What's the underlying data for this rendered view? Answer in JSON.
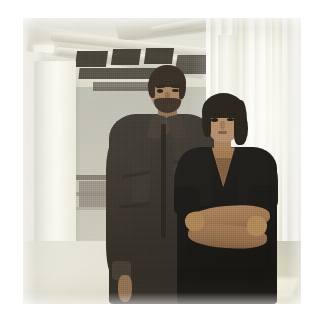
{
  "page": {
    "background_color": "#ffffff",
    "width": 319,
    "height": 321
  },
  "photo": {
    "alt": "Two people standing side by side in an open industrial loft office",
    "frame": {
      "x": 23,
      "y": 18,
      "width": 278,
      "height": 286
    },
    "caption": "",
    "palette": {
      "background_white": "#ffffff",
      "ceiling_light": "#efeee6",
      "ceiling_dark_ducts": "#272219",
      "wall_grey_green": "#c2c1b5",
      "window_bright": "#fbfaf4",
      "floor_warm": "#e9e5cd",
      "man_shirt_dark_brown": "#2d2822",
      "woman_top_black": "#0e0d0b",
      "skin_warm_brown": "#a67f5e",
      "hair_black": "#1d1711"
    },
    "scene": {
      "setting": "open-plan industrial loft interior",
      "lighting": "bright daylight from right-hand windows",
      "elements": [
        {
          "name": "ceiling-ducts",
          "description": "exposed diagonal ductwork and round pipes across the ceiling"
        },
        {
          "name": "ceiling-cavities",
          "description": "dark rectangular openings and HVAC boxes in the ceiling"
        },
        {
          "name": "ceiling-light",
          "description": "small bright fixture at upper left"
        },
        {
          "name": "left-column",
          "description": "white structural column or partition at the left"
        },
        {
          "name": "background-shelving",
          "description": "low shelving and equipment behind the left column"
        },
        {
          "name": "window-blinds",
          "description": "floor-to-ceiling vertical blinds along the right wall"
        },
        {
          "name": "sunlight-patches",
          "description": "angled pools of sunlight on the floor at lower right"
        }
      ],
      "subjects": [
        {
          "name": "man",
          "position": "left",
          "pose": "standing, facing camera",
          "hair": "short dark, receding",
          "facial_hair": "dark beard and moustache",
          "clothing": "dark charcoal-brown long-sleeve button shirt, sleeves rolled"
        },
        {
          "name": "woman",
          "position": "right",
          "pose": "standing, arms crossed",
          "hair": "dark, pulled back",
          "clothing": "black short-sleeve V-neck top"
        }
      ]
    }
  }
}
